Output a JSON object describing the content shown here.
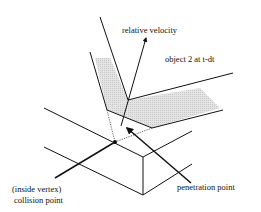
{
  "diagram": {
    "labels": {
      "relative_velocity": "relative  velocity",
      "object2": "object 2  at  t-dt",
      "inside_vertex": "(inside  vertex)",
      "collision_point": "collision  point",
      "penetration_point": "penetration  point"
    },
    "colors": {
      "stroke": "#111111",
      "shade": "#d9d9d9",
      "background": "#ffffff"
    }
  }
}
